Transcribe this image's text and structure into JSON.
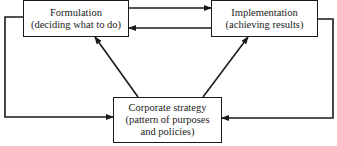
{
  "nodes": {
    "formulation": {
      "title": "Formulation",
      "subtitle": "(deciding what to do)"
    },
    "implementation": {
      "title": "Implementation",
      "subtitle": "(achieving results)"
    },
    "corporate": {
      "title": "Corporate strategy",
      "line2": "(pattern of purposes",
      "line3": "and policies)"
    }
  },
  "edges": [
    {
      "from": "formulation",
      "to": "implementation"
    },
    {
      "from": "implementation",
      "to": "formulation"
    },
    {
      "from": "corporate",
      "to": "formulation"
    },
    {
      "from": "corporate",
      "to": "implementation"
    },
    {
      "from": "formulation",
      "to": "corporate"
    },
    {
      "from": "implementation",
      "to": "corporate"
    }
  ]
}
